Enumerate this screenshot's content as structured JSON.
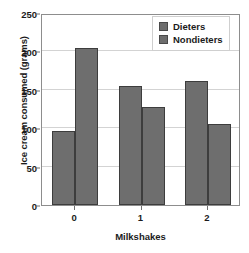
{
  "chart_data": {
    "type": "bar",
    "title": "",
    "xlabel": "Milkshakes",
    "ylabel": "Ice cream consumed (grams)",
    "categories": [
      "0",
      "1",
      "2"
    ],
    "series": [
      {
        "name": "Dieters",
        "values": [
          96,
          155,
          161
        ],
        "color": "#6e6e6e"
      },
      {
        "name": "Nondieters",
        "values": [
          204,
          128,
          105
        ],
        "color": "#6e6e6e"
      }
    ],
    "ylim": [
      0,
      250
    ],
    "yticks": [
      0,
      50,
      100,
      150,
      200,
      250
    ],
    "ytick_labels": [
      "0",
      "50",
      "100",
      "150",
      "200",
      "250"
    ],
    "xtick_labels": [
      "0",
      "1",
      "2"
    ],
    "grid": true,
    "grid_axis": "y",
    "legend": {
      "position": "top-right",
      "entries": [
        {
          "label": "Dieters",
          "color": "#6e6e6e"
        },
        {
          "label": "Nondieters",
          "color": "#6e6e6e"
        }
      ]
    },
    "bar_edge_color": "#3d3d3d",
    "axis_color": "#8d8d8d",
    "gridline_color": "#d3d3d3",
    "background": "#ffffff"
  }
}
